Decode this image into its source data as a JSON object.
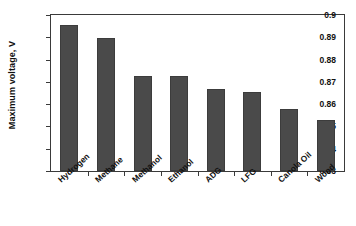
{
  "chart_data": {
    "type": "bar",
    "title": "",
    "xlabel": "",
    "ylabel": "Maximum voltage, V",
    "categories": [
      "Hydrogen",
      "Methane",
      "Methanol",
      "Ethanol",
      "ADG",
      "LFG",
      "Canola Oil",
      "Wood"
    ],
    "values": [
      0.8957,
      0.8898,
      0.8728,
      0.8725,
      0.8669,
      0.8655,
      0.8578,
      0.853
    ],
    "ylim": [
      0.83,
      0.9
    ],
    "ytick_labels": [
      "0.9",
      "0.89",
      "0.88",
      "0.87",
      "0.86",
      "0.85",
      "0.84",
      "0.83"
    ],
    "ytick_values": [
      0.9,
      0.89,
      0.88,
      0.87,
      0.86,
      0.85,
      0.84,
      0.83
    ],
    "grid": false,
    "legend": null,
    "bar_color": "#4a4a4a",
    "axis_color": "#3a3a3a",
    "background_color": "#ffffff"
  }
}
